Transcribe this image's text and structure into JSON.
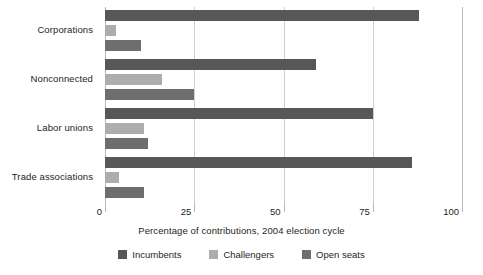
{
  "chart_data": {
    "type": "bar",
    "orientation": "horizontal",
    "title": "",
    "xlabel": "Percentage of contributions, 2004 election cycle",
    "ylabel": "",
    "xlim": [
      0,
      100
    ],
    "xticks": [
      "0",
      "25",
      "50",
      "75",
      "100"
    ],
    "xtick_values": [
      0,
      25,
      50,
      75,
      100
    ],
    "grid": true,
    "legend_position": "bottom",
    "categories": [
      "Corporations",
      "Nonconnected",
      "Labor unions",
      "Trade associations"
    ],
    "series": [
      {
        "name": "Incumbents",
        "color": "#575757",
        "values": [
          88,
          59,
          75,
          86
        ]
      },
      {
        "name": "Challengers",
        "color": "#adadad",
        "values": [
          3,
          16,
          11,
          4
        ]
      },
      {
        "name": "Open seats",
        "color": "#6e6e6e",
        "values": [
          10,
          25,
          12,
          11
        ]
      }
    ]
  },
  "axis": {
    "x_title": "Percentage of contributions, 2004 election cycle",
    "ticks": [
      {
        "label": "0",
        "value": 0
      },
      {
        "label": "25",
        "value": 25
      },
      {
        "label": "50",
        "value": 50
      },
      {
        "label": "75",
        "value": 75
      },
      {
        "label": "100",
        "value": 100
      }
    ]
  },
  "categories": [
    {
      "label": "Corporations"
    },
    {
      "label": "Nonconnected"
    },
    {
      "label": "Labor unions"
    },
    {
      "label": "Trade associations"
    }
  ],
  "legend": [
    {
      "label": "Incumbents",
      "color": "#575757"
    },
    {
      "label": "Challengers",
      "color": "#adadad"
    },
    {
      "label": "Open seats",
      "color": "#6e6e6e"
    }
  ],
  "colors": {
    "incumbents": "#575757",
    "challengers": "#adadad",
    "open_seats": "#6e6e6e",
    "gridline": "#cfcfcf",
    "axis": "#b9b9b9",
    "text": "#231f20",
    "background": "#ffffff"
  }
}
